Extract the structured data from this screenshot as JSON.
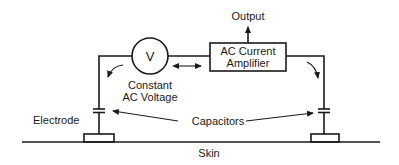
{
  "diagram": {
    "labels": {
      "output": "Output",
      "voltmeter": "V",
      "amplifier_line1": "AC Current",
      "amplifier_line2": "Amplifier",
      "voltage_line1": "Constant",
      "voltage_line2": "AC Voltage",
      "electrode": "Electrode",
      "capacitors": "Capacitors",
      "skin": "Skin"
    },
    "components": [
      "voltage-source",
      "ac-current-amplifier",
      "left-capacitor",
      "right-capacitor",
      "left-electrode",
      "right-electrode",
      "skin-surface"
    ],
    "colors": {
      "line": "#1a1a1a",
      "background": "#ffffff"
    }
  }
}
